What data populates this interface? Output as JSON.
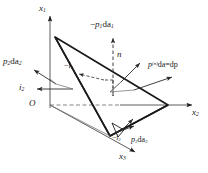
{
  "figure": {
    "type": "cauchy-tetrahedron-diagram",
    "background_color": "#ffffff",
    "line_color": "#1a1a1a",
    "thin_line_color": "#4a4a4a"
  },
  "axes": {
    "origin_label": "O",
    "x1": {
      "label_base": "x",
      "label_sub": "1",
      "direction": "up"
    },
    "x2": {
      "label_base": "x",
      "label_sub": "2",
      "direction": "right"
    },
    "x3": {
      "label_base": "x",
      "label_sub": "3",
      "direction": "lower-left-front"
    }
  },
  "labels": {
    "top_traction": {
      "sign": "−",
      "base": "p",
      "sub": "1",
      "da": "da",
      "da_sub": "1"
    },
    "left_traction": {
      "base": "p",
      "sub": "2",
      "da": "da",
      "da_sub": "2"
    },
    "bottom_traction": {
      "base": "p",
      "sub": "3",
      "da": "da",
      "da_sub": "3"
    },
    "oblique_traction": {
      "base": "p",
      "sup": "(n)",
      "da": "da",
      "eq": "=",
      "dp": "dp"
    },
    "normal_vector": {
      "base": "n"
    },
    "unit_i1": {
      "sign": "−",
      "base": "i",
      "sub": "1"
    },
    "unit_i2": {
      "base": "i",
      "sub": "2"
    },
    "unit_i3": {
      "sign": "−",
      "base": "i",
      "sub": "3"
    }
  },
  "geometry": {
    "apex_x1": [
      55,
      37
    ],
    "vertex_x2": [
      168,
      105
    ],
    "vertex_x3": [
      110,
      136
    ],
    "origin": [
      50,
      105
    ]
  }
}
